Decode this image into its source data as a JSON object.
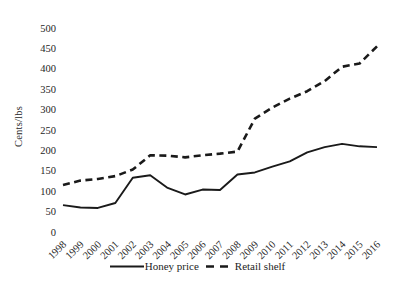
{
  "chart_data": {
    "type": "line",
    "title": "",
    "xlabel": "",
    "ylabel": "Cents/lbs",
    "ylim": [
      0,
      500
    ],
    "yticks": [
      0,
      50,
      100,
      150,
      200,
      250,
      300,
      350,
      400,
      450,
      500
    ],
    "grid": false,
    "legend_position": "bottom",
    "line_color": "#1a1a1a",
    "text_color": "#262626",
    "x": [
      "1998",
      "1999",
      "2000",
      "2001",
      "2002",
      "2003",
      "2004",
      "2005",
      "2006",
      "2007",
      "2008",
      "2009",
      "2010",
      "2011",
      "2012",
      "2013",
      "2014",
      "2015",
      "2016"
    ],
    "series": [
      {
        "name": "Honey price",
        "style": "solid",
        "values": [
          66,
          60,
          59,
          71,
          133,
          139,
          108,
          92,
          104,
          103,
          141,
          146,
          160,
          173,
          195,
          208,
          216,
          210,
          208
        ]
      },
      {
        "name": "Retail shelf",
        "style": "dashed",
        "values": [
          115,
          126,
          130,
          137,
          153,
          188,
          187,
          183,
          188,
          192,
          197,
          278,
          305,
          327,
          345,
          370,
          405,
          413,
          455
        ]
      }
    ]
  }
}
